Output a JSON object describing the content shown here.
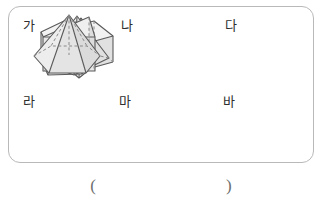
{
  "page": {
    "background_color": "#ffffff",
    "border_color": "#b9b9b9"
  },
  "figure_box": {
    "name": "solid-figures-panel",
    "rows": 2,
    "columns": 3
  },
  "figures": [
    {
      "label": "가",
      "shape_name": "triangular-pyramid",
      "shape_korean": "삼각뿔",
      "faces": 4,
      "base_sides": 3,
      "category": "pyramid"
    },
    {
      "label": "나",
      "shape_name": "rectangular-prism",
      "shape_korean": "직육면체",
      "faces": 6,
      "base_sides": 4,
      "category": "prism"
    },
    {
      "label": "다",
      "shape_name": "pentagonal-prism",
      "shape_korean": "오각기둥",
      "faces": 7,
      "base_sides": 5,
      "category": "prism"
    },
    {
      "label": "라",
      "shape_name": "square-pyramid",
      "shape_korean": "사각뿔",
      "faces": 5,
      "base_sides": 4,
      "category": "pyramid"
    },
    {
      "label": "마",
      "shape_name": "triangular-prism",
      "shape_korean": "삼각기둥",
      "faces": 5,
      "base_sides": 3,
      "category": "prism"
    },
    {
      "label": "바",
      "shape_name": "hexagonal-pyramid",
      "shape_korean": "육각뿔",
      "faces": 7,
      "base_sides": 6,
      "category": "pyramid"
    }
  ],
  "answer": {
    "open_paren": "(",
    "close_paren": ")",
    "value": ""
  },
  "colors": {
    "outline": "#5a5a5a",
    "hidden_edge": "#8a8a8a",
    "face_light": "#f2f2f2",
    "face_mid": "#e8e8e8",
    "face_dark": "#dedede",
    "text": "#2e2e2e",
    "paren": "#6d6d6d"
  }
}
